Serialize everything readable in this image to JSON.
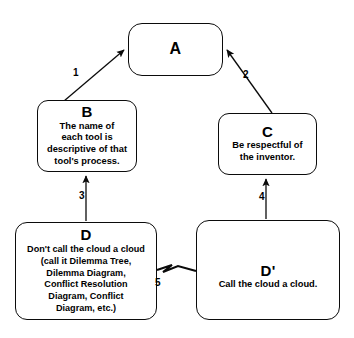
{
  "diagram": {
    "stroke_color": "#0b0b0b",
    "background_color": "#ffffff",
    "nodes": [
      {
        "id": "A",
        "letter": "A",
        "text": ""
      },
      {
        "id": "B",
        "letter": "B",
        "text": "The name of\neach tool is\ndescriptive of that\ntool's process."
      },
      {
        "id": "C",
        "letter": "C",
        "text": "Be respectful of\nthe inventor."
      },
      {
        "id": "D",
        "letter": "D",
        "text": "Don't call the cloud a cloud\n(call it Dilemma Tree,\nDilemma Diagram,\nConflict Resolution\nDiagram, Conflict\nDiagram, etc.)"
      },
      {
        "id": "Dprime",
        "letter": "D'",
        "text": "Call the cloud a cloud."
      }
    ],
    "edges": [
      {
        "id": "e1",
        "label": "1",
        "from": "B",
        "to": "A",
        "kind": "arrow"
      },
      {
        "id": "e2",
        "label": "2",
        "from": "C",
        "to": "A",
        "kind": "arrow"
      },
      {
        "id": "e3",
        "label": "3",
        "from": "D",
        "to": "B",
        "kind": "arrow"
      },
      {
        "id": "e4",
        "label": "4",
        "from": "Dprime",
        "to": "C",
        "kind": "arrow"
      },
      {
        "id": "e5",
        "label": "5",
        "from": "D",
        "to": "Dprime",
        "kind": "conflict-zigzag"
      }
    ]
  }
}
